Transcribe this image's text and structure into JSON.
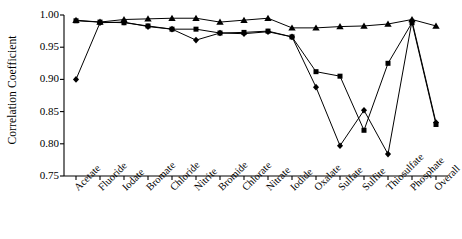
{
  "chart_data": {
    "type": "line",
    "title": "",
    "xlabel": "",
    "ylabel": "Correlation Coefficient",
    "ylim": [
      0.75,
      1.0
    ],
    "ytick_labels": [
      "1.00",
      "0.95",
      "0.90",
      "0.85",
      "0.80",
      "0.75"
    ],
    "ytick_values": [
      1.0,
      0.95,
      0.9,
      0.85,
      0.8,
      0.75
    ],
    "grid": false,
    "legend": "none",
    "categories": [
      "Acetate",
      "Fluoride",
      "Iodate",
      "Bromate",
      "Chloride",
      "Nitrite",
      "Bromide",
      "Chlorate",
      "Nitrate",
      "Iodide",
      "Oxalate",
      "Sulfate",
      "Sulfite",
      "Thiosulfate",
      "Phosphate",
      "Overall"
    ],
    "series": [
      {
        "name": "series-diamond",
        "marker": "diamond",
        "color": "#000000",
        "values": [
          0.9,
          0.988,
          0.989,
          0.982,
          0.978,
          0.961,
          0.972,
          0.971,
          0.974,
          0.966,
          0.888,
          0.797,
          0.852,
          0.784,
          0.991,
          0.833
        ]
      },
      {
        "name": "series-square",
        "marker": "square",
        "color": "#000000",
        "values": [
          0.991,
          0.989,
          0.988,
          0.983,
          0.978,
          0.978,
          0.972,
          0.973,
          0.975,
          0.966,
          0.912,
          0.905,
          0.821,
          0.925,
          0.988,
          0.83
        ]
      },
      {
        "name": "series-triangle",
        "marker": "triangle",
        "color": "#000000",
        "values": [
          0.992,
          0.989,
          0.993,
          0.994,
          0.995,
          0.995,
          0.989,
          0.992,
          0.995,
          0.98,
          0.98,
          0.982,
          0.983,
          0.986,
          0.993,
          0.983
        ]
      }
    ]
  }
}
